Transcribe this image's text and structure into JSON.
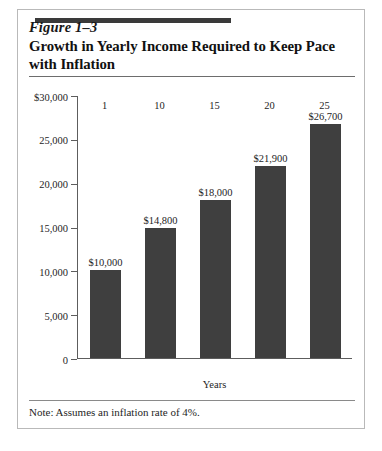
{
  "figure": {
    "number": "Figure 1–3",
    "title": "Growth in Yearly Income Required to Keep Pace with Inflation",
    "note": "Note:  Assumes an inflation rate of 4%."
  },
  "colors": {
    "bar_fill": "#3f3f3f",
    "accent_bar": "#3a3a3a",
    "axis": "#5d5d5d",
    "card_border": "#b9b9b9",
    "background": "#ffffff",
    "text": "#1a1a1a"
  },
  "chart_data": {
    "type": "bar",
    "title": "Growth in Yearly Income Required to Keep Pace with Inflation",
    "xlabel": "Years",
    "ylabel": "",
    "categories": [
      "1",
      "10",
      "15",
      "20",
      "25"
    ],
    "values": [
      10000,
      14800,
      18000,
      21900,
      26700
    ],
    "value_labels": [
      "$10,000",
      "$14,800",
      "$18,000",
      "$21,900",
      "$26,700"
    ],
    "ylim": [
      0,
      30000
    ],
    "yticks": [
      0,
      5000,
      10000,
      15000,
      20000,
      25000,
      30000
    ],
    "ytick_labels": [
      "0",
      "5,000",
      "10,000",
      "15,000",
      "20,000",
      "25,000",
      "$30,000"
    ],
    "grid": false,
    "legend": "none",
    "annotation": "Note:  Assumes an inflation rate of 4%."
  }
}
